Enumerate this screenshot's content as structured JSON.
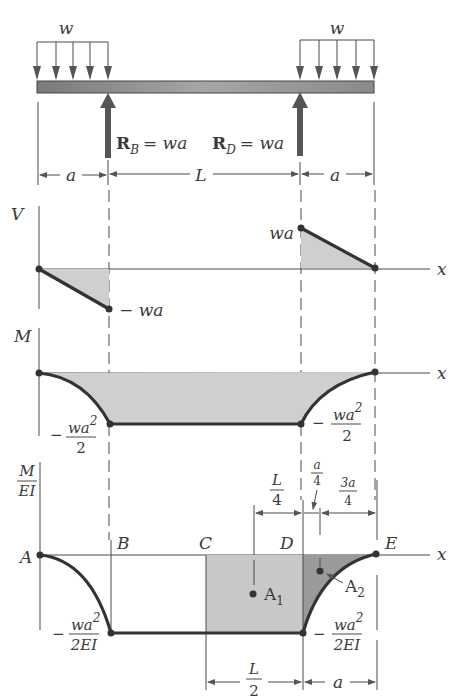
{
  "figure": {
    "beam": {
      "load_left_label": "w",
      "load_right_label": "w",
      "reaction_B": {
        "symbol": "R",
        "subscript": "B",
        "value": "= wa"
      },
      "reaction_D": {
        "symbol": "R",
        "subscript": "D",
        "value": "= wa"
      },
      "dimensions": {
        "left": "a",
        "middle": "L",
        "right": "a"
      }
    },
    "shear_diagram": {
      "axis_label": "V",
      "x_label": "x",
      "left_value": "− wa",
      "right_value": "wa"
    },
    "moment_diagram": {
      "axis_label": "M",
      "x_label": "x",
      "left_value_minus": "−",
      "left_value_num": "wa",
      "left_value_exp": "2",
      "left_value_den": "2",
      "right_value_minus": "−",
      "right_value_num": "wa",
      "right_value_exp": "2",
      "right_value_den": "2"
    },
    "m_ei_diagram": {
      "axis_label_num": "M",
      "axis_label_den": "EI",
      "x_label": "x",
      "points": {
        "A": "A",
        "B": "B",
        "C": "C",
        "D": "D",
        "E": "E"
      },
      "area_1": {
        "letter": "A",
        "subscript": "1"
      },
      "area_2": {
        "letter": "A",
        "subscript": "2"
      },
      "left_value": {
        "minus": "−",
        "num": "wa",
        "exp": "2",
        "den": "2EI"
      },
      "right_value": {
        "minus": "−",
        "num": "wa",
        "exp": "2",
        "den": "2EI"
      },
      "top_dims": {
        "L_over_4": {
          "num": "L",
          "den": "4"
        },
        "a_over_4": {
          "num": "a",
          "den": "4"
        },
        "three_a_over_4": {
          "num": "3a",
          "den": "4"
        }
      },
      "bottom_dims": {
        "L_over_2": {
          "num": "L",
          "den": "2"
        },
        "a": "a"
      }
    },
    "colors": {
      "ink": "#333333",
      "shade_light": "#c8c8c8",
      "shade_dark": "#9a9a9a",
      "beam": "#8a8a8a",
      "background": "#ffffff"
    }
  }
}
